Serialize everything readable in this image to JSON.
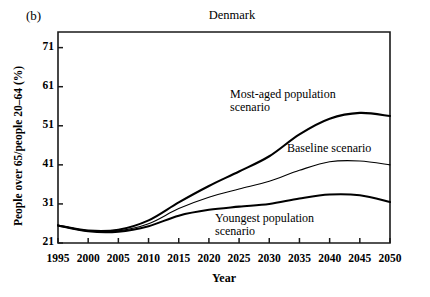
{
  "panel": {
    "label": "(b)"
  },
  "chart_data": {
    "type": "line",
    "title": "Denmark",
    "xlabel": "Year",
    "ylabel": "People over 65/people 20–64 (%)",
    "xlim": [
      1995,
      2050
    ],
    "ylim": [
      21,
      75
    ],
    "grid": false,
    "legend_position": "inline-annotations",
    "xticks": [
      1995,
      2000,
      2005,
      2010,
      2015,
      2020,
      2025,
      2030,
      2035,
      2040,
      2045,
      2050
    ],
    "yticks": [
      21,
      31,
      41,
      51,
      61,
      71
    ],
    "x": [
      1995,
      2000,
      2005,
      2010,
      2015,
      2020,
      2025,
      2030,
      2035,
      2040,
      2045,
      2050
    ],
    "series": [
      {
        "name": "Most-aged population scenario",
        "annotation": "Most-aged population scenario",
        "values": [
          25.5,
          24.2,
          24.4,
          26.8,
          31.4,
          35.6,
          39.3,
          43.2,
          48.8,
          52.8,
          54.3,
          53.5
        ],
        "color": "#000000",
        "width": 2.1
      },
      {
        "name": "Baseline scenario",
        "annotation": "Baseline scenario",
        "values": [
          25.5,
          24.1,
          24.1,
          25.9,
          29.8,
          32.7,
          34.8,
          36.8,
          39.6,
          41.8,
          42.0,
          41.0
        ],
        "color": "#000000",
        "width": 1.1
      },
      {
        "name": "Youngest population scenario",
        "annotation": "Youngest population scenario",
        "values": [
          25.5,
          24.0,
          23.9,
          25.3,
          28.0,
          29.5,
          30.3,
          31.0,
          32.4,
          33.4,
          33.2,
          31.5
        ],
        "color": "#000000",
        "width": 2.1
      }
    ],
    "annotations": [
      {
        "text_line1": "Most-aged population",
        "text_line2": "scenario"
      },
      {
        "text_line1": "Baseline scenario",
        "text_line2": ""
      },
      {
        "text_line1": "Youngest population",
        "text_line2": "scenario"
      }
    ]
  }
}
